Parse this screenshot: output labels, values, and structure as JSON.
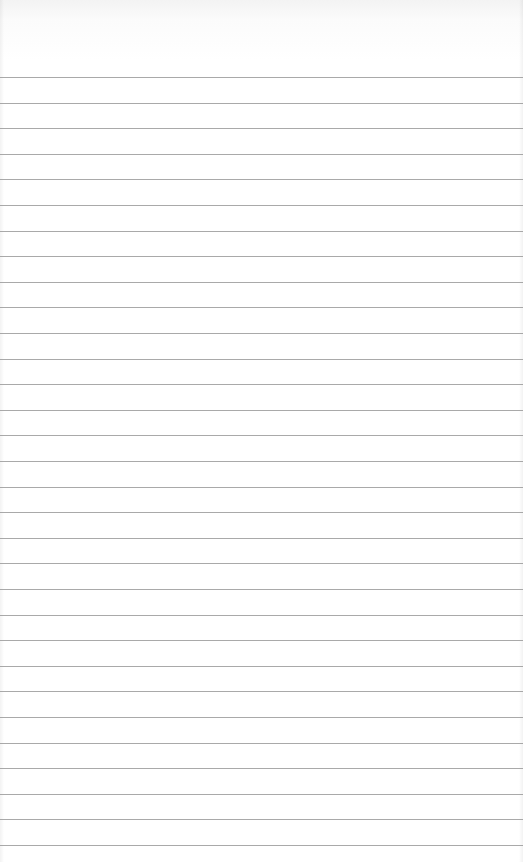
{
  "page": {
    "type": "ruled-notebook-page",
    "background_color": "#ffffff",
    "rule_color": "#9a9a9a",
    "rule_count": 31,
    "first_rule_y": 77,
    "rule_spacing": 25.6
  }
}
